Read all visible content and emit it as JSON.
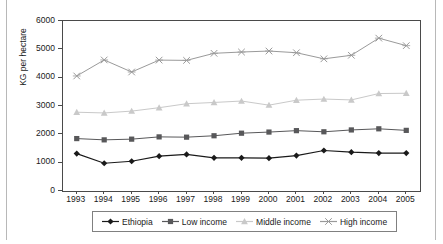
{
  "chart_data": {
    "type": "line",
    "title": "",
    "xlabel": "",
    "ylabel": "KG per hectare",
    "categories": [
      "1993",
      "1994",
      "1995",
      "1996",
      "1997",
      "1998",
      "1999",
      "2000",
      "2001",
      "2002",
      "2003",
      "2004",
      "2005"
    ],
    "x": [
      1993,
      1994,
      1995,
      1996,
      1997,
      1998,
      1999,
      2000,
      2001,
      2002,
      2003,
      2004,
      2005
    ],
    "ylim": [
      0,
      6000
    ],
    "yticks": [
      0,
      1000,
      2000,
      3000,
      4000,
      5000,
      6000
    ],
    "ytick_labels": [
      "0",
      "1000",
      "2000",
      "3000",
      "4000",
      "5000",
      "6000"
    ],
    "grid": false,
    "legend_position": "bottom",
    "series": [
      {
        "name": "Ethiopia",
        "marker": "diamond",
        "color": "#1a1a1a",
        "values": [
          1320,
          980,
          1050,
          1230,
          1290,
          1170,
          1170,
          1160,
          1250,
          1430,
          1370,
          1340,
          1340
        ]
      },
      {
        "name": "Low income",
        "marker": "square",
        "color": "#58585a",
        "values": [
          1850,
          1805,
          1830,
          1910,
          1900,
          1950,
          2040,
          2080,
          2130,
          2090,
          2155,
          2195,
          2140
        ]
      },
      {
        "name": "Middle income",
        "marker": "triangle",
        "color": "#c9c9c9",
        "values": [
          2780,
          2755,
          2820,
          2940,
          3080,
          3125,
          3175,
          3030,
          3205,
          3245,
          3215,
          3440,
          3450
        ]
      },
      {
        "name": "High income",
        "marker": "cross",
        "color": "#9a9a9a",
        "values": [
          4060,
          4625,
          4200,
          4620,
          4610,
          4860,
          4905,
          4940,
          4880,
          4665,
          4790,
          5395,
          5130
        ]
      }
    ]
  },
  "legend": {
    "items": [
      {
        "label": "Ethiopia"
      },
      {
        "label": "Low income"
      },
      {
        "label": "Middle income"
      },
      {
        "label": "High income"
      }
    ]
  }
}
